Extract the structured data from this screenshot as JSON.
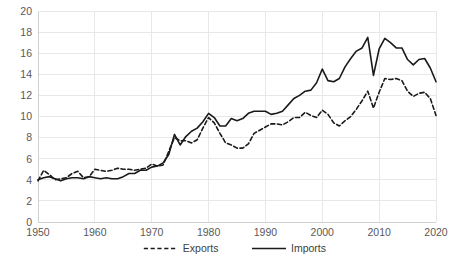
{
  "chart_data": {
    "type": "line",
    "title": "",
    "subtitle": "",
    "xlabel": "",
    "ylabel": "",
    "xlim": [
      1950,
      2020
    ],
    "ylim": [
      0,
      20
    ],
    "x_ticks": [
      1950,
      1960,
      1970,
      1980,
      1990,
      2000,
      2010,
      2020
    ],
    "y_ticks": [
      0,
      2,
      4,
      6,
      8,
      10,
      12,
      14,
      16,
      18,
      20
    ],
    "grid": true,
    "grid_axis": "both",
    "legend": [
      "Exports",
      "Imports"
    ],
    "legend_position": "bottom",
    "x": [
      1950,
      1951,
      1952,
      1953,
      1954,
      1955,
      1956,
      1957,
      1958,
      1959,
      1960,
      1961,
      1962,
      1963,
      1964,
      1965,
      1966,
      1967,
      1968,
      1969,
      1970,
      1971,
      1972,
      1973,
      1974,
      1975,
      1976,
      1977,
      1978,
      1979,
      1980,
      1981,
      1982,
      1983,
      1984,
      1985,
      1986,
      1987,
      1988,
      1989,
      1990,
      1991,
      1992,
      1993,
      1994,
      1995,
      1996,
      1997,
      1998,
      1999,
      2000,
      2001,
      2002,
      2003,
      2004,
      2005,
      2006,
      2007,
      2008,
      2009,
      2010,
      2011,
      2012,
      2013,
      2014,
      2015,
      2016,
      2017,
      2018,
      2019,
      2020
    ],
    "series": [
      {
        "name": "Exports",
        "style": "dashed",
        "color": "#1a1a1a",
        "values": [
          3.9,
          4.9,
          4.5,
          4.0,
          4.1,
          4.2,
          4.6,
          4.8,
          4.2,
          4.3,
          5.0,
          4.9,
          4.8,
          4.9,
          5.1,
          5.0,
          5.0,
          4.9,
          5.0,
          5.1,
          5.5,
          5.3,
          5.4,
          6.7,
          8.0,
          7.7,
          7.7,
          7.5,
          7.8,
          8.9,
          9.9,
          9.4,
          8.4,
          7.5,
          7.3,
          7.0,
          7.0,
          7.4,
          8.4,
          8.7,
          9.0,
          9.3,
          9.3,
          9.2,
          9.5,
          9.9,
          9.9,
          10.4,
          10.1,
          9.9,
          10.6,
          10.2,
          9.4,
          9.1,
          9.6,
          10.0,
          10.7,
          11.5,
          12.4,
          10.8,
          12.3,
          13.6,
          13.5,
          13.6,
          13.4,
          12.4,
          11.9,
          12.2,
          12.3,
          11.7,
          10.1
        ]
      },
      {
        "name": "Imports",
        "style": "solid",
        "color": "#1a1a1a",
        "values": [
          4.0,
          4.2,
          4.3,
          4.1,
          3.9,
          4.1,
          4.2,
          4.2,
          4.1,
          4.3,
          4.2,
          4.1,
          4.2,
          4.1,
          4.1,
          4.3,
          4.6,
          4.6,
          4.9,
          4.9,
          5.2,
          5.3,
          5.6,
          6.4,
          8.3,
          7.3,
          8.1,
          8.6,
          8.9,
          9.5,
          10.3,
          9.9,
          9.1,
          9.1,
          9.8,
          9.6,
          9.8,
          10.3,
          10.5,
          10.5,
          10.5,
          10.2,
          10.3,
          10.5,
          11.1,
          11.7,
          12.0,
          12.4,
          12.5,
          13.2,
          14.5,
          13.4,
          13.3,
          13.6,
          14.7,
          15.5,
          16.2,
          16.5,
          17.5,
          13.9,
          16.4,
          17.4,
          17.0,
          16.5,
          16.5,
          15.4,
          14.9,
          15.4,
          15.5,
          14.6,
          13.3
        ]
      }
    ]
  },
  "axes": {
    "y_tick_labels": [
      "0",
      "2",
      "4",
      "6",
      "8",
      "10",
      "12",
      "14",
      "16",
      "18",
      "20"
    ],
    "x_tick_labels": [
      "1950",
      "1960",
      "1970",
      "1980",
      "1990",
      "2000",
      "2010",
      "2020"
    ]
  },
  "legend": {
    "items": [
      {
        "label": "Exports",
        "style": "dashed"
      },
      {
        "label": "Imports",
        "style": "solid"
      }
    ]
  },
  "colors": {
    "line": "#1a1a1a",
    "grid": "#e8e8e8",
    "axis": "#d0d0d0",
    "tick_text": "#595959",
    "legend_text": "#404040",
    "background": "#ffffff"
  }
}
